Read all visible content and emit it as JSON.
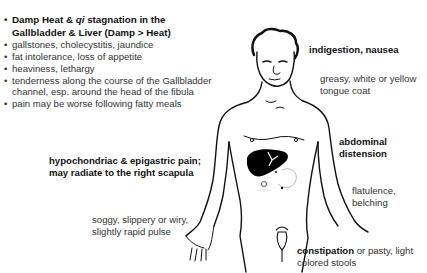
{
  "left_list": {
    "heading_parts": [
      "Damp Heat & ",
      "qi",
      " stagnation in the Gallbladder & Liver (Damp > Heat)"
    ],
    "items": [
      "gallstones, cholecystitis, jaundice",
      "fat intolerance, loss of appetite",
      "heaviness, lethargy",
      "tenderness along the course of the Gallbladder channel, esp. around the head of the fibula",
      "pain may be worse following fatty meals"
    ]
  },
  "labels": {
    "indigestion": "indigestion, nausea",
    "tongue": "greasy, white or yellow tongue coat",
    "abdominal": "abdominal distension",
    "pain": "hypochondriac & epigastric pain; may radiate to the right scapula",
    "pulse": "soggy, slippery or wiry, slightly rapid pulse",
    "flatulence": "flatulence, belching",
    "stools_bold": "constipation",
    "stools_rest": " or pasty, light colored stools"
  },
  "figure": {
    "liver_color": "#000000",
    "line_color": "#111111"
  }
}
